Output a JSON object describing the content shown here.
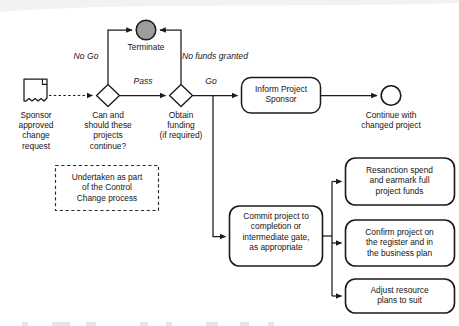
{
  "diagram": {
    "type": "bpmn-flowchart",
    "colors": {
      "stroke": "#1b1b1b",
      "text": "#161616",
      "terminate_fill": "#9d9d9d",
      "background": "#ffffff"
    },
    "nodes": {
      "start_document": {
        "shape": "document",
        "label": "Sponsor\napproved\nchange\nrequest"
      },
      "gateway_continue": {
        "shape": "diamond",
        "label": "Can and\nshould these\nprojects\ncontinue?"
      },
      "gateway_funding": {
        "shape": "diamond",
        "label": "Obtain\nfunding\n(if required)"
      },
      "terminate": {
        "shape": "circle-filled",
        "label": "Terminate"
      },
      "inform_sponsor": {
        "shape": "rounded-rect",
        "label": "Inform Project\nSponsor"
      },
      "end_event": {
        "shape": "circle",
        "label": "Continue with\nchanged project"
      },
      "commit_project": {
        "shape": "rounded-rect",
        "label": "Commit project to\ncompletion or\nintermediate gate,\nas appropriate"
      },
      "resanction_spend": {
        "shape": "rounded-rect",
        "label": "Resanction spend\nand earmark full\nproject funds"
      },
      "confirm_register": {
        "shape": "rounded-rect",
        "label": "Confirm project on\nthe register and in\nthe business plan"
      },
      "adjust_resource": {
        "shape": "rounded-rect",
        "label": "Adjust resource\nplans to suit"
      },
      "annotation_control_change": {
        "shape": "dashed-rect",
        "label": "Undertaken as part\nof the Control\nChange process"
      }
    },
    "edge_labels": {
      "no_go": "No Go",
      "pass": "Pass",
      "go": "Go",
      "no_funds_granted": "No funds granted"
    }
  }
}
